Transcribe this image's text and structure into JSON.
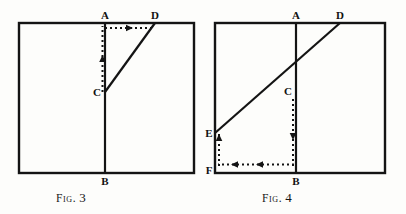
{
  "page": {
    "width": 406,
    "height": 214,
    "background_color": "#fdfdfb",
    "ink_color": "#141414"
  },
  "figures": [
    {
      "id": "fig3",
      "caption_word": "Fig.",
      "caption_number": "3",
      "frame": {
        "x": 19,
        "y": 23,
        "width": 175,
        "height": 150
      },
      "points": {
        "A": {
          "label": "A",
          "x": 105,
          "y": 23,
          "label_x": 105,
          "label_y": 15
        },
        "B": {
          "label": "B",
          "x": 105,
          "y": 173,
          "label_x": 105,
          "label_y": 184
        },
        "C": {
          "label": "C",
          "x": 105,
          "y": 92,
          "label_x": 96,
          "label_y": 95
        },
        "D": {
          "label": "D",
          "x": 155,
          "y": 23,
          "label_x": 152,
          "label_y": 15
        }
      },
      "solid_segments": [
        {
          "name": "segment-AB",
          "from": "A",
          "to": "B"
        },
        {
          "name": "segment-CD",
          "from": "C",
          "to": "D"
        }
      ],
      "dotted_paths": [
        {
          "name": "dotted-C-to-A",
          "from": "C",
          "to": "A",
          "arrow": "up",
          "arrow_at": 0.5
        },
        {
          "name": "dotted-A-to-D",
          "from": "A",
          "to": "D",
          "arrow": "right",
          "arrow_at": 0.55
        }
      ]
    },
    {
      "id": "fig4",
      "caption_word": "Fig.",
      "caption_number": "4",
      "frame": {
        "x": 215,
        "y": 23,
        "width": 170,
        "height": 150
      },
      "points": {
        "A": {
          "label": "A",
          "x": 296,
          "y": 23,
          "label_x": 296,
          "label_y": 15
        },
        "B": {
          "label": "B",
          "x": 296,
          "y": 173,
          "label_x": 296,
          "label_y": 184
        },
        "C": {
          "label": "C",
          "x": 296,
          "y": 97,
          "label_x": 287,
          "label_y": 94
        },
        "D": {
          "label": "D",
          "x": 340,
          "y": 23,
          "label_x": 337,
          "label_y": 15
        },
        "E": {
          "label": "E",
          "x": 215,
          "y": 133,
          "label_x": 209,
          "label_y": 134
        },
        "F": {
          "label": "F",
          "x": 215,
          "y": 167,
          "label_x": 209,
          "label_y": 172
        }
      },
      "solid_segments": [
        {
          "name": "segment-AB",
          "from": "A",
          "to": "B"
        },
        {
          "name": "segment-ED",
          "from": "E",
          "to": "D"
        }
      ],
      "dotted_paths": [
        {
          "name": "dotted-C-to-B",
          "from": "C",
          "to": "B",
          "arrow": "down",
          "arrow_at": 0.5
        },
        {
          "name": "dotted-B-to-F",
          "from": "B",
          "to": "F",
          "arrow": "left",
          "arrow_at": 0.35
        },
        {
          "name": "dotted-F-to-E",
          "from": "F",
          "to": "E",
          "arrow": "up",
          "arrow_at": 0.75
        }
      ]
    }
  ]
}
